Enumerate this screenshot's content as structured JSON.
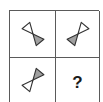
{
  "puzzle": {
    "type": "2x2 matrix reasoning puzzle",
    "colors": {
      "border": "#5a5a5a",
      "shape_outline": "#333333",
      "light_fill": "#ffffff",
      "dark_fill": "#a0a0a0"
    },
    "cells": [
      {
        "position": "top-left",
        "content": "hourglass-shape",
        "description": "bow-tie of two triangles meeting at apex; white triangle upper-left, gray triangle lower-right",
        "rotation_deg": -40
      },
      {
        "position": "top-right",
        "content": "hourglass-shape",
        "description": "bow-tie of two triangles meeting at apex; white triangle upper-right, gray triangle lower-left",
        "rotation_deg": 40
      },
      {
        "position": "bottom-left",
        "content": "hourglass-shape",
        "description": "bow-tie of two triangles meeting at apex; gray triangle upper-right, white triangle lower-left",
        "rotation_deg": 220
      },
      {
        "position": "bottom-right",
        "content": "question-mark",
        "label": "?"
      }
    ]
  }
}
